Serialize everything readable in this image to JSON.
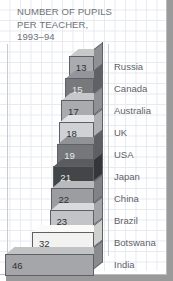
{
  "figure": {
    "title": "NUMBER OF PUPILS\nPER TEACHER,\n1993–94",
    "title_line_1": "NUMBER OF PUPILS",
    "title_line_2": "PER TEACHER,",
    "title_line_3": "1993–94"
  },
  "chart_data": {
    "type": "bar",
    "orientation": "horizontal",
    "title": "NUMBER OF PUPILS PER TEACHER, 1993–94",
    "xlabel": "",
    "ylabel": "",
    "categories": [
      "Russia",
      "Canada",
      "Australia",
      "UK",
      "USA",
      "Japan",
      "China",
      "Brazil",
      "Botswana",
      "India"
    ],
    "values": [
      13,
      15,
      17,
      18,
      19,
      21,
      22,
      23,
      32,
      46
    ],
    "value_labels": [
      "13",
      "15",
      "17",
      "18",
      "19",
      "21",
      "22",
      "23",
      "32",
      "46"
    ],
    "bar_colors": [
      "#a9abae",
      "#77797d",
      "#a9abae",
      "#cfd1d4",
      "#75777b",
      "#434649",
      "#9b9da1",
      "#c2c4c7",
      "#f2f2f0",
      "#a4a6a9"
    ],
    "grid": true,
    "legend": "none",
    "xlim": [
      0,
      46
    ]
  },
  "bars": [
    {
      "value": "13",
      "country": "Russia",
      "color": "#a9abae",
      "side": "#8e9093",
      "top": "#c6c8ca",
      "dark_text": false
    },
    {
      "value": "15",
      "country": "Canada",
      "color": "#77797d",
      "side": "#5f6164",
      "top": "#93959a",
      "dark_text": true
    },
    {
      "value": "17",
      "country": "Australia",
      "color": "#a9abae",
      "side": "#8e9093",
      "top": "#c6c8ca",
      "dark_text": false
    },
    {
      "value": "18",
      "country": "UK",
      "color": "#cfd1d4",
      "side": "#aeb0b3",
      "top": "#e2e3e5",
      "dark_text": false
    },
    {
      "value": "19",
      "country": "USA",
      "color": "#75777b",
      "side": "#5d5f63",
      "top": "#909296",
      "dark_text": true
    },
    {
      "value": "21",
      "country": "Japan",
      "color": "#434649",
      "side": "#343639",
      "top": "#5a5c60",
      "dark_text": true
    },
    {
      "value": "22",
      "country": "China",
      "color": "#9b9da1",
      "side": "#808285",
      "top": "#b8babd",
      "dark_text": false
    },
    {
      "value": "23",
      "country": "Brazil",
      "color": "#c2c4c7",
      "side": "#a2a4a7",
      "top": "#d8dadc",
      "dark_text": false
    },
    {
      "value": "32",
      "country": "Botswana",
      "color": "#f2f2f0",
      "side": "#cfd0ce",
      "top": "#fafaf9",
      "dark_text": false
    },
    {
      "value": "46",
      "country": "India",
      "color": "#a4a6a9",
      "side": "#898b8e",
      "top": "#c1c3c5",
      "dark_text": false
    }
  ]
}
